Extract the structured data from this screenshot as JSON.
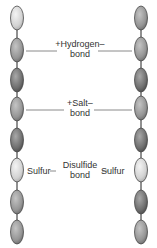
{
  "diagram": {
    "type": "protein-bonds",
    "colors": {
      "background": "#ffffff",
      "strand_line": "#222222",
      "bond_line": "#8a8a8a",
      "text": "#333333",
      "bead_light": "#dcdcdc",
      "bead_mid": "#9a9a9a",
      "bead_dark": "#6e6e6e",
      "bead_outline": "#4a4a4a"
    },
    "left_chain": {
      "x": 17,
      "beads": [
        {
          "y": 18,
          "shade": "light"
        },
        {
          "y": 50,
          "shade": "mid"
        },
        {
          "y": 80,
          "shade": "dark"
        },
        {
          "y": 109,
          "shade": "mid"
        },
        {
          "y": 140,
          "shade": "dark"
        },
        {
          "y": 170,
          "shade": "light"
        },
        {
          "y": 202,
          "shade": "mid"
        },
        {
          "y": 232,
          "shade": "mid"
        }
      ]
    },
    "right_chain": {
      "x": 141,
      "beads": [
        {
          "y": 18,
          "shade": "mid"
        },
        {
          "y": 49,
          "shade": "mid"
        },
        {
          "y": 80,
          "shade": "dark"
        },
        {
          "y": 108,
          "shade": "mid"
        },
        {
          "y": 140,
          "shade": "dark"
        },
        {
          "y": 170,
          "shade": "light"
        },
        {
          "y": 202,
          "shade": "dark"
        },
        {
          "y": 232,
          "shade": "mid"
        }
      ]
    },
    "bonds": [
      {
        "name": "hydrogen-bond",
        "line1": "+Hydrogen–",
        "line2": "bond",
        "y": 50
      },
      {
        "name": "salt-bond",
        "line1": "+Salt–",
        "line2": "bond",
        "y": 109
      },
      {
        "name": "disulfide-bond",
        "line1": "Disulfide",
        "line2": "bond",
        "y": 170,
        "left_atom": "Sulfur",
        "right_atom": "Sulfur"
      }
    ]
  }
}
